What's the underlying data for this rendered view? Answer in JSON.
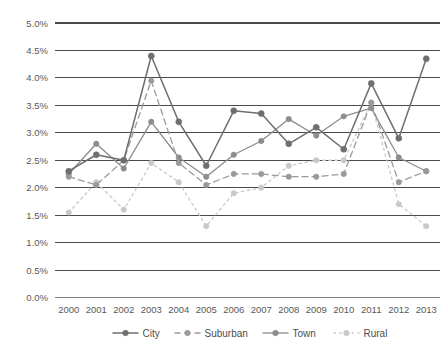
{
  "chart_data": {
    "type": "line",
    "title": "",
    "subtitle": "",
    "xlabel": "",
    "ylabel": "",
    "categories": [
      "2000",
      "2001",
      "2002",
      "2003",
      "2004",
      "2005",
      "2006",
      "2007",
      "2008",
      "2009",
      "2010",
      "2011",
      "2012",
      "2013"
    ],
    "ylim": [
      0.0,
      5.0
    ],
    "ytick_values": [
      0.0,
      0.5,
      1.0,
      1.5,
      2.0,
      2.5,
      3.0,
      3.5,
      4.0,
      4.5,
      5.0
    ],
    "ytick_labels": [
      "0.0%",
      "0.5%",
      "1.0%",
      "1.5%",
      "2.0%",
      "2.5%",
      "3.0%",
      "3.5%",
      "4.0%",
      "4.5%",
      "5.0%"
    ],
    "grid": true,
    "grid_axis": "y",
    "legend_position": "bottom",
    "value_unit": "%",
    "series": [
      {
        "name": "City",
        "color": "#6e6e6e",
        "dash": "solid",
        "marker": "circle",
        "values": [
          2.3,
          2.6,
          2.5,
          4.4,
          3.2,
          2.4,
          3.4,
          3.35,
          2.8,
          3.1,
          2.7,
          3.9,
          2.9,
          4.35
        ]
      },
      {
        "name": "Suburban",
        "color": "#9a9a9a",
        "dash": "dashed",
        "marker": "circle",
        "values": [
          2.2,
          2.05,
          2.5,
          3.95,
          2.45,
          2.05,
          2.25,
          2.25,
          2.2,
          2.2,
          2.25,
          3.55,
          2.1,
          2.3
        ]
      },
      {
        "name": "Town",
        "color": "#8c8c8c",
        "dash": "solid",
        "marker": "circle",
        "values": [
          2.25,
          2.8,
          2.35,
          3.2,
          2.55,
          2.2,
          2.6,
          2.85,
          3.25,
          2.95,
          3.3,
          3.45,
          2.55,
          2.3
        ]
      },
      {
        "name": "Rural",
        "color": "#c9c9c9",
        "dash": "dotted",
        "marker": "circle",
        "values": [
          1.55,
          2.1,
          1.6,
          2.45,
          2.1,
          1.3,
          1.9,
          2.0,
          2.4,
          2.5,
          2.5,
          3.55,
          1.7,
          1.3
        ]
      }
    ]
  },
  "legend": {
    "items": [
      {
        "label": "City"
      },
      {
        "label": "Suburban"
      },
      {
        "label": "Town"
      },
      {
        "label": "Rural"
      }
    ]
  }
}
